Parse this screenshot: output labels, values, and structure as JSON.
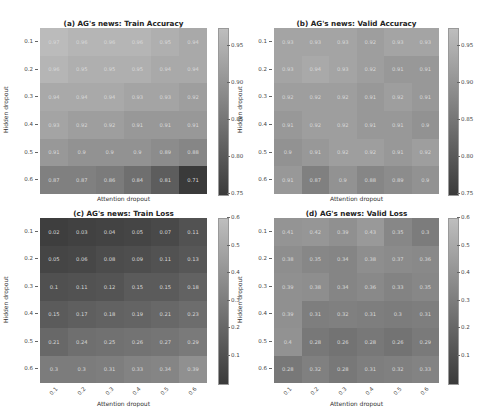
{
  "chart_data": [
    {
      "type": "heatmap",
      "title": "(a) AG's news: Train Accuracy",
      "xlabel": "Attention dropout",
      "ylabel": "Hidden dropout",
      "x": [
        "0.1",
        "0.2",
        "0.3",
        "0.4",
        "0.5",
        "0.6"
      ],
      "y": [
        "0.1",
        "0.2",
        "0.3",
        "0.4",
        "0.5",
        "0.6"
      ],
      "values": [
        [
          0.97,
          0.96,
          0.96,
          0.96,
          0.95,
          0.94
        ],
        [
          0.96,
          0.95,
          0.95,
          0.95,
          0.94,
          0.94
        ],
        [
          0.94,
          0.94,
          0.94,
          0.93,
          0.93,
          0.92
        ],
        [
          0.93,
          0.92,
          0.92,
          0.91,
          0.91,
          0.91
        ],
        [
          0.91,
          0.9,
          0.9,
          0.9,
          0.89,
          0.88
        ],
        [
          0.87,
          0.87,
          0.86,
          0.84,
          0.81,
          0.71
        ]
      ],
      "colorbar": {
        "range": [
          0.75,
          0.975
        ],
        "ticks": [
          "0.95",
          "0.90",
          "0.85",
          "0.80",
          "0.75"
        ]
      }
    },
    {
      "type": "heatmap",
      "title": "(b) AG's news: Valid Accuracy",
      "xlabel": "Attention dropout",
      "ylabel": "Hidden dropout",
      "x": [
        "0.1",
        "0.2",
        "0.3",
        "0.4",
        "0.5",
        "0.6"
      ],
      "y": [
        "0.1",
        "0.2",
        "0.3",
        "0.4",
        "0.5",
        "0.6"
      ],
      "values": [
        [
          0.93,
          0.93,
          0.93,
          0.92,
          0.93,
          0.93
        ],
        [
          0.93,
          0.94,
          0.93,
          0.92,
          0.91,
          0.91
        ],
        [
          0.92,
          0.92,
          0.92,
          0.91,
          0.92,
          0.91
        ],
        [
          0.91,
          0.92,
          0.92,
          0.91,
          0.91,
          0.9
        ],
        [
          0.9,
          0.91,
          0.92,
          0.92,
          0.91,
          0.92
        ],
        [
          0.91,
          0.87,
          0.9,
          0.88,
          0.89,
          0.9
        ]
      ],
      "colorbar": {
        "range": [
          0.75,
          0.975
        ],
        "ticks": [
          "0.95",
          "0.90",
          "0.85",
          "0.80",
          "0.75"
        ]
      }
    },
    {
      "type": "heatmap",
      "title": "(c) AG's news: Train Loss",
      "xlabel": "Attention dropout",
      "ylabel": "Hidden dropout",
      "x": [
        "0.1",
        "0.2",
        "0.3",
        "0.4",
        "0.5",
        "0.6"
      ],
      "y": [
        "0.1",
        "0.2",
        "0.3",
        "0.4",
        "0.5",
        "0.6"
      ],
      "values": [
        [
          0.02,
          0.03,
          0.04,
          0.05,
          0.07,
          0.11
        ],
        [
          0.05,
          0.06,
          0.08,
          0.09,
          0.11,
          0.13
        ],
        [
          0.1,
          0.11,
          0.12,
          0.15,
          0.15,
          0.18
        ],
        [
          0.15,
          0.17,
          0.18,
          0.19,
          0.21,
          0.23
        ],
        [
          0.21,
          0.24,
          0.25,
          0.26,
          0.27,
          0.29
        ],
        [
          0.3,
          0.3,
          0.31,
          0.33,
          0.34,
          0.39
        ]
      ],
      "colorbar": {
        "range": [
          0.0,
          0.6
        ],
        "ticks": [
          "0.6",
          "0.5",
          "0.4",
          "0.3",
          "0.2",
          "0.1"
        ]
      }
    },
    {
      "type": "heatmap",
      "title": "(d) AG's news: Valid Loss",
      "xlabel": "Attention dropout",
      "ylabel": "Hidden dropout",
      "x": [
        "0.1",
        "0.2",
        "0.3",
        "0.4",
        "0.5",
        "0.6"
      ],
      "y": [
        "0.1",
        "0.2",
        "0.3",
        "0.4",
        "0.5",
        "0.6"
      ],
      "values": [
        [
          0.41,
          0.42,
          0.39,
          0.43,
          0.35,
          0.3
        ],
        [
          0.38,
          0.35,
          0.34,
          0.38,
          0.37,
          0.36
        ],
        [
          0.39,
          0.38,
          0.34,
          0.36,
          0.33,
          0.35
        ],
        [
          0.39,
          0.31,
          0.32,
          0.31,
          0.3,
          0.31
        ],
        [
          0.4,
          0.28,
          0.26,
          0.28,
          0.26,
          0.29
        ],
        [
          0.28,
          0.32,
          0.28,
          0.31,
          0.32,
          0.33
        ]
      ],
      "colorbar": {
        "range": [
          0.0,
          0.6
        ],
        "ticks": [
          "0.6",
          "0.5",
          "0.4",
          "0.3",
          "0.2",
          "0.1"
        ]
      }
    }
  ]
}
